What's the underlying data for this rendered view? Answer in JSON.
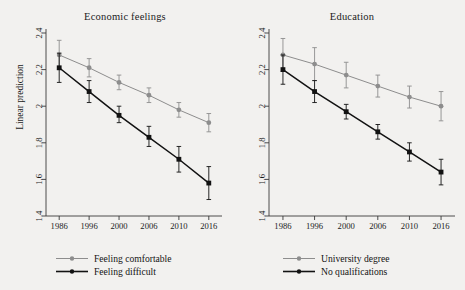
{
  "figure": {
    "background": "#f2f1ef",
    "ylabel": "Linear prediction",
    "series_colors": {
      "light": "#8d8d8d",
      "dark": "#121212"
    }
  },
  "chart_data": [
    {
      "type": "line",
      "title": "Economic feelings",
      "xlabel": "",
      "ylabel": "Linear prediction",
      "x": [
        "1986",
        "1996",
        "2000",
        "2006",
        "2010",
        "2016"
      ],
      "xtick_labels": [
        "1986",
        "1996",
        "2000",
        "2006",
        "2010",
        "2016"
      ],
      "ytick_labels": [
        "1.4",
        "1.6",
        "1.8",
        "2",
        "2.2",
        "2.4"
      ],
      "yticks": [
        1.4,
        1.6,
        1.8,
        2.0,
        2.2,
        2.4
      ],
      "ylim": [
        1.4,
        2.4
      ],
      "grid": false,
      "legend_position": "below",
      "series": [
        {
          "name": "Feeling comfortable",
          "color": "#8d8d8d",
          "marker": "circle",
          "values": [
            2.28,
            2.21,
            2.13,
            2.06,
            1.98,
            1.91
          ],
          "ci_low": [
            2.2,
            2.16,
            2.09,
            2.02,
            1.94,
            1.86
          ],
          "ci_high": [
            2.36,
            2.26,
            2.17,
            2.1,
            2.02,
            1.96
          ]
        },
        {
          "name": "Feeling difficult",
          "color": "#121212",
          "marker": "square",
          "values": [
            2.21,
            2.08,
            1.95,
            1.83,
            1.71,
            1.58
          ],
          "ci_low": [
            2.13,
            2.02,
            1.91,
            1.78,
            1.64,
            1.49
          ],
          "ci_high": [
            2.29,
            2.14,
            2.0,
            1.89,
            1.78,
            1.67
          ]
        }
      ]
    },
    {
      "type": "line",
      "title": "Education",
      "xlabel": "",
      "ylabel": "",
      "x": [
        "1986",
        "1996",
        "2000",
        "2006",
        "2010",
        "2016"
      ],
      "xtick_labels": [
        "1986",
        "1996",
        "2000",
        "2006",
        "2010",
        "2016"
      ],
      "ytick_labels": [
        "1.4",
        "1.6",
        "1.8",
        "2",
        "2.2",
        "2.4"
      ],
      "yticks": [
        1.4,
        1.6,
        1.8,
        2.0,
        2.2,
        2.4
      ],
      "ylim": [
        1.4,
        2.4
      ],
      "grid": false,
      "legend_position": "below",
      "series": [
        {
          "name": "University degree",
          "color": "#8d8d8d",
          "marker": "circle",
          "values": [
            2.28,
            2.23,
            2.17,
            2.11,
            2.05,
            2.0
          ],
          "ci_low": [
            2.19,
            2.14,
            2.1,
            2.05,
            1.99,
            1.92
          ],
          "ci_high": [
            2.37,
            2.32,
            2.24,
            2.17,
            2.11,
            2.08
          ]
        },
        {
          "name": "No qualifications",
          "color": "#121212",
          "marker": "square",
          "values": [
            2.2,
            2.08,
            1.97,
            1.86,
            1.75,
            1.64
          ],
          "ci_low": [
            2.12,
            2.02,
            1.93,
            1.82,
            1.7,
            1.57
          ],
          "ci_high": [
            2.28,
            2.14,
            2.01,
            1.9,
            1.8,
            1.71
          ]
        }
      ]
    }
  ]
}
